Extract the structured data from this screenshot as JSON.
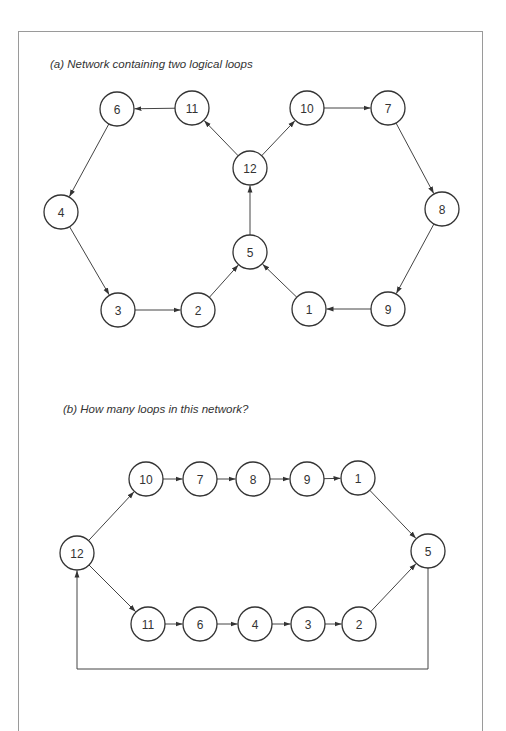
{
  "figure_a": {
    "caption": "(a) Network containing two logical loops",
    "nodes": [
      {
        "id": "6",
        "x": 117,
        "y": 109
      },
      {
        "id": "11",
        "x": 192,
        "y": 108
      },
      {
        "id": "12",
        "x": 250,
        "y": 168
      },
      {
        "id": "10",
        "x": 307,
        "y": 108
      },
      {
        "id": "7",
        "x": 388,
        "y": 108
      },
      {
        "id": "8",
        "x": 442,
        "y": 209
      },
      {
        "id": "9",
        "x": 388,
        "y": 309
      },
      {
        "id": "1",
        "x": 309,
        "y": 309
      },
      {
        "id": "5",
        "x": 250,
        "y": 252
      },
      {
        "id": "2",
        "x": 198,
        "y": 310
      },
      {
        "id": "3",
        "x": 118,
        "y": 310
      },
      {
        "id": "4",
        "x": 61,
        "y": 212
      }
    ],
    "edges": [
      [
        "11",
        "6"
      ],
      [
        "6",
        "4"
      ],
      [
        "4",
        "3"
      ],
      [
        "3",
        "2"
      ],
      [
        "2",
        "5"
      ],
      [
        "5",
        "12"
      ],
      [
        "12",
        "11"
      ],
      [
        "12",
        "10"
      ],
      [
        "10",
        "7"
      ],
      [
        "7",
        "8"
      ],
      [
        "8",
        "9"
      ],
      [
        "9",
        "1"
      ],
      [
        "1",
        "5"
      ]
    ]
  },
  "figure_b": {
    "caption": "(b) How many loops in this network?",
    "nodes": [
      {
        "id": "12",
        "x": 77,
        "y": 553
      },
      {
        "id": "10",
        "x": 146,
        "y": 479
      },
      {
        "id": "7",
        "x": 200,
        "y": 479
      },
      {
        "id": "8",
        "x": 253,
        "y": 479
      },
      {
        "id": "9",
        "x": 307,
        "y": 479
      },
      {
        "id": "1",
        "x": 358,
        "y": 478
      },
      {
        "id": "5",
        "x": 428,
        "y": 551
      },
      {
        "id": "11",
        "x": 148,
        "y": 624
      },
      {
        "id": "6",
        "x": 200,
        "y": 624
      },
      {
        "id": "4",
        "x": 255,
        "y": 624
      },
      {
        "id": "3",
        "x": 308,
        "y": 624
      },
      {
        "id": "2",
        "x": 359,
        "y": 624
      }
    ],
    "edges": [
      [
        "12",
        "10"
      ],
      [
        "10",
        "7"
      ],
      [
        "7",
        "8"
      ],
      [
        "8",
        "9"
      ],
      [
        "9",
        "1"
      ],
      [
        "1",
        "5"
      ],
      [
        "12",
        "11"
      ],
      [
        "11",
        "6"
      ],
      [
        "6",
        "4"
      ],
      [
        "4",
        "3"
      ],
      [
        "3",
        "2"
      ],
      [
        "2",
        "5"
      ]
    ],
    "return_path": {
      "from": "5",
      "to": "12",
      "bottom_y": 669
    }
  },
  "node_radius": 17
}
